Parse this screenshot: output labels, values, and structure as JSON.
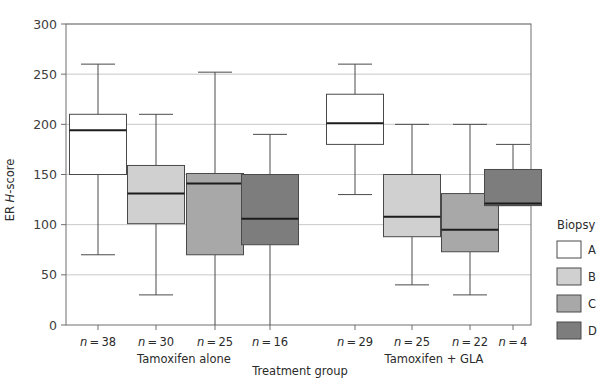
{
  "chart_data": {
    "type": "box",
    "title": "",
    "xlabel": "Treatment group",
    "ylabel": "ER H-score",
    "ylim": [
      0,
      300
    ],
    "yticks": [
      0,
      50,
      100,
      150,
      200,
      250,
      300
    ],
    "ytick_labels": [
      "0",
      "50",
      "100",
      "150",
      "200",
      "250",
      "300"
    ],
    "grid": true,
    "legend": {
      "title": "Biopsy",
      "position": "right",
      "entries": [
        {
          "label": "A",
          "color": "#ffffff"
        },
        {
          "label": "B",
          "color": "#d0d0d0"
        },
        {
          "label": "C",
          "color": "#a8a8a8"
        },
        {
          "label": "D",
          "color": "#7d7d7d"
        }
      ]
    },
    "groups": [
      {
        "name": "Tamoxifen alone",
        "boxes": [
          {
            "biopsy": "A",
            "n_label": "n = 38",
            "n": 38,
            "color": "#ffffff",
            "whisker_low": 70,
            "q1": 150,
            "median": 194,
            "q3": 210,
            "whisker_high": 260
          },
          {
            "biopsy": "B",
            "n_label": "n = 30",
            "n": 30,
            "color": "#d0d0d0",
            "whisker_low": 30,
            "q1": 101,
            "median": 131,
            "q3": 159,
            "whisker_high": 210
          },
          {
            "biopsy": "C",
            "n_label": "n = 25",
            "n": 25,
            "color": "#a8a8a8",
            "whisker_low": 0,
            "q1": 70,
            "median": 141,
            "q3": 151,
            "whisker_high": 252
          },
          {
            "biopsy": "D",
            "n_label": "n = 16",
            "n": 16,
            "color": "#7d7d7d",
            "whisker_low": 0,
            "q1": 80,
            "median": 106,
            "q3": 150,
            "whisker_high": 190
          }
        ]
      },
      {
        "name": "Tamoxifen + GLA",
        "boxes": [
          {
            "biopsy": "A",
            "n_label": "n = 29",
            "n": 29,
            "color": "#ffffff",
            "whisker_low": 130,
            "q1": 180,
            "median": 201,
            "q3": 230,
            "whisker_high": 260
          },
          {
            "biopsy": "B",
            "n_label": "n = 25",
            "n": 25,
            "color": "#d0d0d0",
            "whisker_low": 40,
            "q1": 88,
            "median": 108,
            "q3": 150,
            "whisker_high": 200
          },
          {
            "biopsy": "C",
            "n_label": "n = 22",
            "n": 22,
            "color": "#a8a8a8",
            "whisker_low": 30,
            "q1": 73,
            "median": 95,
            "q3": 131,
            "whisker_high": 200
          },
          {
            "biopsy": "D",
            "n_label": "n = 4",
            "n": 4,
            "color": "#7d7d7d",
            "whisker_low": 119,
            "q1": 119,
            "median": 121,
            "q3": 155,
            "whisker_high": 180
          }
        ]
      }
    ]
  },
  "axis": {
    "y_title_prefix": "ER ",
    "y_title_italic": "H",
    "y_title_suffix": "-score",
    "x_title": "Treatment group"
  },
  "legend": {
    "title": "Biopsy"
  }
}
